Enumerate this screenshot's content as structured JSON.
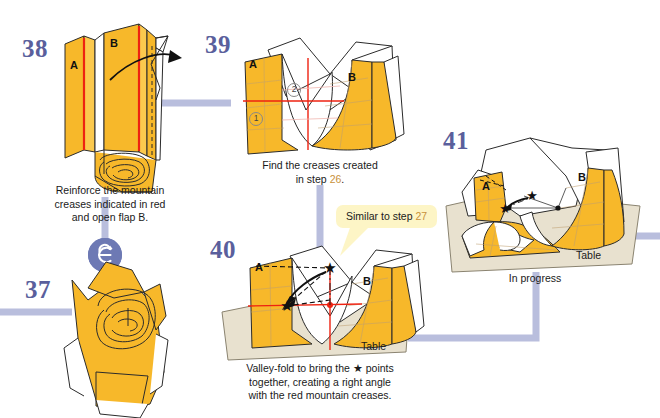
{
  "page": {
    "background": "#ffffff"
  },
  "palette": {
    "paper_front": "#f7b82a",
    "paper_front_light": "#fbc94e",
    "paper_back": "#ffffff",
    "outline": "#2b2b2b",
    "crease_red": "#ee2211",
    "table": "#e8e1cf",
    "table_edge": "#8a8370",
    "connector": "#b9bedd",
    "step_number": "#5a5f9c",
    "callout_bg": "#fdf5c6",
    "highlight_text": "#c8913a",
    "badge": "#6d79b4"
  },
  "steps": [
    {
      "id": "step-37",
      "number": "37",
      "caption_lines": [],
      "labels": []
    },
    {
      "id": "step-38",
      "number": "38",
      "caption_lines": [
        "Reinforce the mountain",
        "creases indicated in red",
        "and open flap B."
      ],
      "labels": [
        "A",
        "B"
      ]
    },
    {
      "id": "step-39",
      "number": "39",
      "caption_prefix": "Find the creases created",
      "caption_line2_pre": "in step ",
      "caption_line2_ref": "26",
      "caption_line2_post": ".",
      "labels": [
        "A",
        "B"
      ],
      "circled": [
        "1",
        "2"
      ]
    },
    {
      "id": "step-40",
      "number": "40",
      "caption_lines": [
        "Valley-fold to bring the ★ points",
        "together, creating a right angle",
        "with the red mountain creases."
      ],
      "labels": [
        "A",
        "B"
      ],
      "table_label": "Table"
    },
    {
      "id": "step-41",
      "number": "41",
      "caption_lines": [
        "In progress"
      ],
      "labels": [
        "A",
        "B"
      ],
      "table_label": "Table"
    }
  ],
  "callout": {
    "pre": "Similar to step ",
    "ref": "27",
    "post": ""
  },
  "icons": {
    "rotate_badge": "turn-over-icon",
    "star": "★"
  }
}
